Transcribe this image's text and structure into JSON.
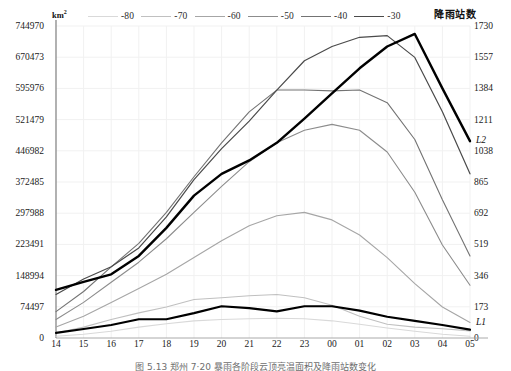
{
  "axes": {
    "left_unit": "km",
    "left_unit_sup": "2",
    "right_title": "降雨站数"
  },
  "series_labels": {
    "upper": "L2",
    "lower": "L1"
  },
  "caption": "图 5.13  郑州 7·20 暴雨各阶段云顶亮温面积及降雨站数变化",
  "chart_data": {
    "type": "line",
    "title": "",
    "xlabel": "",
    "ylabel": "km²",
    "y2label": "降雨站数",
    "grid": true,
    "legend_position": "top",
    "x": [
      "14",
      "15",
      "16",
      "17",
      "18",
      "19",
      "20",
      "21",
      "22",
      "23",
      "00",
      "01",
      "02",
      "03",
      "04",
      "05"
    ],
    "ylim": [
      0,
      744970
    ],
    "yticks": [
      0,
      74497,
      148994,
      223491,
      297988,
      372485,
      446982,
      521479,
      595976,
      670473,
      744970
    ],
    "y2lim": [
      0,
      1730
    ],
    "y2ticks": [
      0,
      173,
      346,
      519,
      692,
      865,
      1038,
      1211,
      1384,
      1557,
      1730
    ],
    "series": [
      {
        "name": "-80",
        "color": "#d9d9d9",
        "width": 1.1,
        "values": [
          4000,
          9000,
          16000,
          26000,
          34000,
          41000,
          44000,
          46000,
          47000,
          46000,
          41000,
          33000,
          24000,
          16000,
          9000,
          4000
        ]
      },
      {
        "name": "-70",
        "color": "#c0c0c0",
        "width": 1.1,
        "values": [
          12000,
          26000,
          44000,
          60000,
          74000,
          92000,
          96000,
          101000,
          104000,
          96000,
          78000,
          52000,
          33000,
          26000,
          22000,
          17000
        ]
      },
      {
        "name": "-60",
        "color": "#a6a6a6",
        "width": 1.1,
        "values": [
          26000,
          52000,
          85000,
          118000,
          152000,
          192000,
          232000,
          268000,
          292000,
          300000,
          282000,
          246000,
          192000,
          130000,
          74000,
          37000
        ]
      },
      {
        "name": "-50",
        "color": "#8c8c8c",
        "width": 1.1,
        "values": [
          44000,
          85000,
          133000,
          181000,
          237000,
          300000,
          362000,
          421000,
          466000,
          496000,
          510000,
          496000,
          444000,
          348000,
          222000,
          126000
        ]
      },
      {
        "name": "-40",
        "color": "#737373",
        "width": 1.1,
        "values": [
          63000,
          111000,
          170000,
          226000,
          300000,
          385000,
          466000,
          540000,
          592000,
          592000,
          590000,
          592000,
          562000,
          474000,
          330000,
          196000
        ]
      },
      {
        "name": "-30",
        "color": "#4a4a4a",
        "width": 1.2,
        "values": [
          104000,
          141000,
          170000,
          215000,
          289000,
          378000,
          452000,
          518000,
          592000,
          662000,
          696000,
          718000,
          722000,
          670000,
          540000,
          392000
        ]
      },
      {
        "name": "L2",
        "color": "#000000",
        "width": 2.4,
        "values": [
          115000,
          134000,
          152000,
          196000,
          263000,
          340000,
          392000,
          424000,
          466000,
          524000,
          584000,
          644000,
          696000,
          726000,
          596000,
          470000
        ]
      },
      {
        "name": "L1",
        "color": "#000000",
        "width": 2.2,
        "axis": "right",
        "values": [
          28,
          50,
          72,
          104,
          104,
          138,
          176,
          166,
          148,
          176,
          176,
          152,
          118,
          95,
          72,
          46
        ]
      }
    ]
  }
}
